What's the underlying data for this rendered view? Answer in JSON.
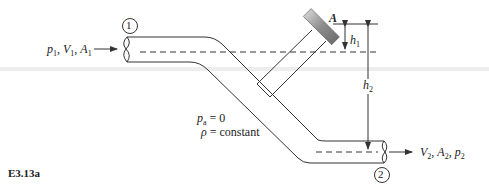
{
  "figure": {
    "label": "E3.13a",
    "stations": {
      "inlet": "1",
      "outlet": "2"
    },
    "point_label": "A",
    "inlet_vars": {
      "p": "p",
      "p_sub": "1",
      "V": "V",
      "V_sub": "1",
      "A": "A",
      "A_sub": "1"
    },
    "outlet_vars": {
      "V": "V",
      "V_sub": "2",
      "A": "A",
      "A_sub": "2",
      "p": "p",
      "p_sub": "2"
    },
    "h1": {
      "sym": "h",
      "sub": "1"
    },
    "h2": {
      "sym": "h",
      "sub": "2"
    },
    "conditions": {
      "pa": {
        "sym": "p",
        "sub": "a",
        "rest": " = 0"
      },
      "rho": {
        "sym": "ρ",
        "rest": " = constant"
      }
    },
    "colors": {
      "line": "#333333",
      "cap_fill": "#9a9a9a",
      "band": "#e6e6e6"
    }
  }
}
